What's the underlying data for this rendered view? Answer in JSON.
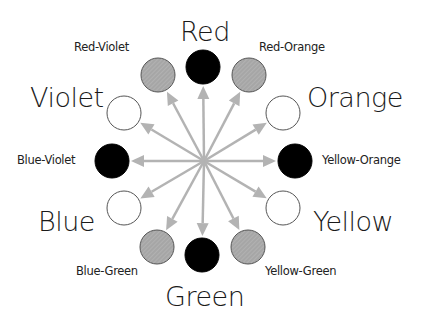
{
  "diagram": {
    "center": {
      "x": 204,
      "y": 161
    },
    "colors": {
      "primary_fill": "#000000",
      "secondary_fill": "#ffffff",
      "tertiary_fill": "#a9a9a9",
      "arrow": "#b3b3b3",
      "stroke": "#555555"
    },
    "nodes": [
      {
        "name": "Red",
        "type": "primary",
        "x": 203,
        "y": 67
      },
      {
        "name": "Red-Orange",
        "type": "tertiary",
        "x": 249,
        "y": 75
      },
      {
        "name": "Orange",
        "type": "secondary",
        "x": 283,
        "y": 113
      },
      {
        "name": "Yellow-Orange",
        "type": "primary",
        "x": 295,
        "y": 161
      },
      {
        "name": "Yellow",
        "type": "secondary",
        "x": 283,
        "y": 208
      },
      {
        "name": "Yellow-Green",
        "type": "tertiary",
        "x": 248,
        "y": 247
      },
      {
        "name": "Green",
        "type": "primary",
        "x": 202,
        "y": 255
      },
      {
        "name": "Blue-Green",
        "type": "tertiary",
        "x": 157,
        "y": 247
      },
      {
        "name": "Blue",
        "type": "secondary",
        "x": 124,
        "y": 208
      },
      {
        "name": "Blue-Violet",
        "type": "primary",
        "x": 112,
        "y": 161
      },
      {
        "name": "Violet",
        "type": "secondary",
        "x": 124,
        "y": 113
      },
      {
        "name": "Red-Violet",
        "type": "tertiary",
        "x": 158,
        "y": 75
      }
    ],
    "labels": {
      "red": "Red",
      "red_orange": "Red-Orange",
      "orange": "Orange",
      "yellow_orange": "Yellow-Orange",
      "yellow": "Yellow",
      "yellow_green": "Yellow-Green",
      "green": "Green",
      "blue_green": "Blue-Green",
      "blue": "Blue",
      "blue_violet": "Blue-Violet",
      "violet": "Violet",
      "red_violet": "Red-Violet"
    }
  }
}
